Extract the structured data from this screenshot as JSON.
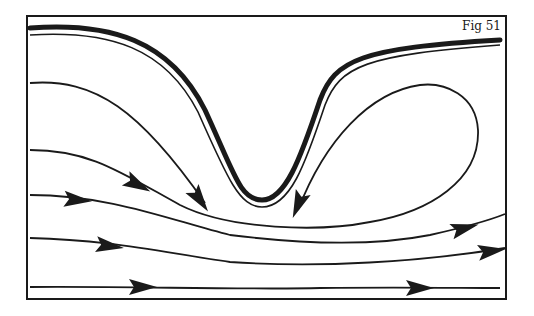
{
  "figure": {
    "label": "Fig 51",
    "colors": {
      "ink": "#1a1a1a",
      "background": "#ffffff"
    }
  },
  "boundary": {
    "type": "thick-wall",
    "path": "M30,28 C110,22 170,40 205,110 C235,175 240,200 262,200 C285,200 300,160 320,100 C335,60 360,48 500,40"
  },
  "streamlines": [
    {
      "id": "wall-inner",
      "path": "M30,35 C110,30 165,48 198,112 C228,180 240,207 262,207 C290,207 305,165 325,105 C340,66 365,55 500,45",
      "arrows": []
    },
    {
      "id": "line-a",
      "path": "M30,83 C95,78 140,110 205,203",
      "arrows": [
        {
          "x": 200,
          "y": 200,
          "angle": 55
        }
      ]
    },
    {
      "id": "line-b-eddy",
      "path": "M30,150 C90,150 120,172 180,205 C230,230 320,232 370,222 C430,212 480,180 478,130 C476,95 445,82 420,85 C370,92 325,140 298,210",
      "arrows": [
        {
          "x": 138,
          "y": 185,
          "angle": 28
        },
        {
          "x": 298,
          "y": 205,
          "angle": 112
        }
      ]
    },
    {
      "id": "line-c",
      "path": "M30,195 C110,195 170,220 230,235 C310,245 380,245 430,235 C470,226 490,220 505,214",
      "arrows": [
        {
          "x": 78,
          "y": 200,
          "angle": 5
        },
        {
          "x": 465,
          "y": 228,
          "angle": -15
        }
      ]
    },
    {
      "id": "line-d",
      "path": "M30,238 C110,240 160,252 230,262 C320,268 420,262 505,248",
      "arrows": [
        {
          "x": 110,
          "y": 246,
          "angle": 8
        },
        {
          "x": 492,
          "y": 251,
          "angle": -8
        }
      ]
    },
    {
      "id": "line-e",
      "path": "M30,287 C120,286 250,290 320,288 C400,287 460,288 500,288",
      "arrows": [
        {
          "x": 143,
          "y": 287,
          "angle": 0
        },
        {
          "x": 420,
          "y": 288,
          "angle": 0
        }
      ]
    }
  ]
}
